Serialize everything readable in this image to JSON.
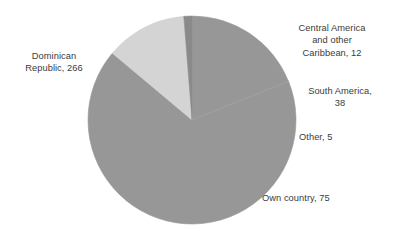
{
  "chart_data": {
    "type": "pie",
    "title": "",
    "subtitle": "",
    "xlabel": "",
    "ylabel": "",
    "legend": "none",
    "grid": false,
    "total": 396,
    "categories": [
      "Own country",
      "Dominican Republic",
      "Central America and other Caribbean",
      "South America",
      "Other"
    ],
    "values": [
      75,
      266,
      12,
      38,
      5
    ],
    "slices": [
      {
        "name": "Own country",
        "value": 75,
        "label": "Own country, 75",
        "color": "#979797",
        "start_angle": 0.0,
        "end_angle": 68.2
      },
      {
        "name": "Dominican Republic",
        "value": 266,
        "label": "Dominican\nRepublic, 266",
        "color": "#979797",
        "start_angle": 68.2,
        "end_angle": 310.0
      },
      {
        "name": "Central America and other Caribbean",
        "value": 12,
        "label": "Central America\nand other\nCaribbean, 12",
        "color": "#d4d4d4",
        "start_angle": 310.0,
        "end_angle": 320.9
      },
      {
        "name": "South America",
        "value": 38,
        "label": "South America,\n38",
        "color": "#d4d4d4",
        "start_angle": 320.9,
        "end_angle": 355.5
      },
      {
        "name": "Other",
        "value": 5,
        "label": "Other, 5",
        "color": "#8a8a8a",
        "start_angle": 355.5,
        "end_angle": 360.0
      }
    ],
    "labels": {
      "dominican_republic": "Dominican\nRepublic, 266",
      "central_america": "Central America\nand other\nCaribbean, 12",
      "south_america": "South America,\n38",
      "other": "Other, 5",
      "own_country": "Own country, 75"
    },
    "colors": {
      "main_slice": "#979797",
      "light_slice": "#d4d4d4",
      "thin_slice": "#8a8a8a",
      "slice_outline": "#bdbdbd",
      "text": "#3b3b3b",
      "background": "#ffffff"
    }
  }
}
